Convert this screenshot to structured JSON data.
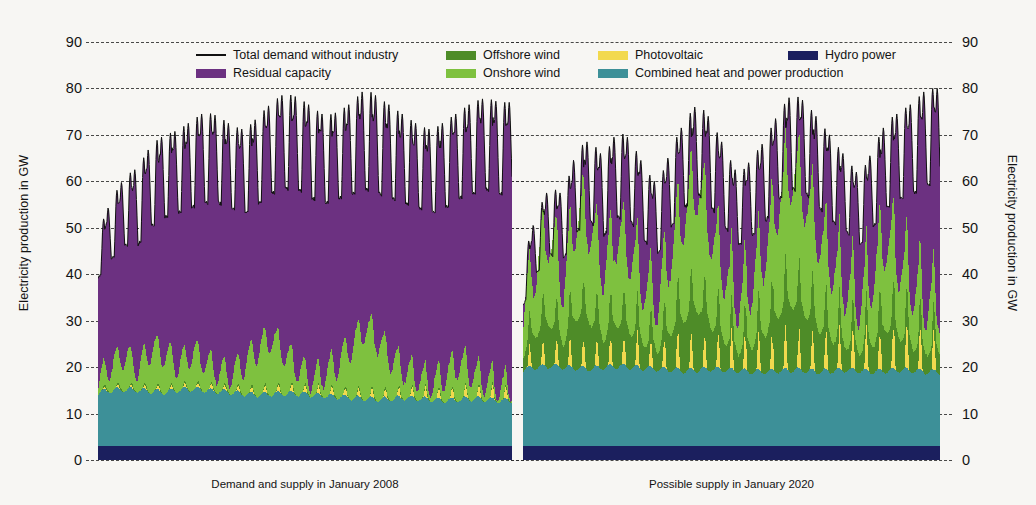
{
  "chart_data": {
    "type": "area",
    "title": "",
    "ylabel": "Electricity production in GW",
    "xlabel": "",
    "ylim": [
      0,
      90
    ],
    "yticks": [
      0,
      10,
      20,
      30,
      40,
      50,
      60,
      70,
      80,
      90
    ],
    "grid": true,
    "legend_position": "top-center",
    "stack_order_bottom_to_top": [
      "Hydro power",
      "Combined heat and power production",
      "Photovoltaic",
      "Offshore wind",
      "Onshore wind",
      "Residual capacity"
    ],
    "legend": [
      {
        "label": "Total demand without industry",
        "color": "#111111",
        "marker": "line"
      },
      {
        "label": "Residual capacity",
        "color": "#6c3181",
        "marker": "swatch"
      },
      {
        "label": "Offshore wind",
        "color": "#4e8c28",
        "marker": "swatch"
      },
      {
        "label": "Onshore wind",
        "color": "#7ec13f",
        "marker": "swatch"
      },
      {
        "label": "Photovoltaic",
        "color": "#f2d94e",
        "marker": "swatch"
      },
      {
        "label": "Combined heat and power production",
        "color": "#3d9098",
        "marker": "swatch"
      },
      {
        "label": "Hydro power",
        "color": "#1b1f5e",
        "marker": "swatch"
      }
    ],
    "panels": [
      {
        "id": "left",
        "caption": "Demand and supply in January 2008",
        "x_range_days": [
          1,
          31
        ],
        "series": {
          "hydro": [
            3.0,
            3.0,
            3.0,
            3.0,
            3.0,
            3.0,
            3.0,
            3.0,
            3.0,
            3.0,
            3.0,
            3.0,
            3.0,
            3.0,
            3.0,
            3.0,
            3.0,
            3.0,
            3.0,
            3.0,
            3.0,
            3.0,
            3.0,
            3.0,
            3.0,
            3.0,
            3.0,
            3.0,
            3.0,
            3.0,
            3.0
          ],
          "chp": [
            11.5,
            12.0,
            12.2,
            12.0,
            11.8,
            11.6,
            12.0,
            12.3,
            12.0,
            11.8,
            11.5,
            11.2,
            11.0,
            11.2,
            11.4,
            11.2,
            11.0,
            10.8,
            10.6,
            10.4,
            10.2,
            10.0,
            10.2,
            10.4,
            10.2,
            10.0,
            9.8,
            10.0,
            10.2,
            10.0,
            9.8
          ],
          "photovoltaic": [
            0.2,
            0.2,
            0.2,
            0.3,
            0.3,
            0.3,
            0.3,
            0.4,
            0.4,
            0.4,
            0.4,
            0.4,
            0.5,
            0.5,
            0.5,
            0.5,
            0.6,
            0.6,
            0.6,
            0.6,
            0.7,
            0.7,
            0.7,
            0.7,
            0.8,
            0.8,
            0.8,
            0.8,
            0.9,
            0.9,
            0.9
          ],
          "offshore_wind": [
            0.1,
            0.1,
            0.1,
            0.1,
            0.1,
            0.1,
            0.1,
            0.1,
            0.1,
            0.1,
            0.1,
            0.1,
            0.1,
            0.1,
            0.1,
            0.1,
            0.1,
            0.1,
            0.1,
            0.1,
            0.1,
            0.1,
            0.1,
            0.1,
            0.1,
            0.1,
            0.1,
            0.1,
            0.1,
            0.1,
            0.1
          ],
          "onshore_wind": [
            2.0,
            5.5,
            7.0,
            4.5,
            9.0,
            8.0,
            5.0,
            7.5,
            6.0,
            4.0,
            3.5,
            6.5,
            9.5,
            12.0,
            8.0,
            5.0,
            3.0,
            4.5,
            7.0,
            11.0,
            15.0,
            12.0,
            8.0,
            5.5,
            4.0,
            3.0,
            5.0,
            7.5,
            5.0,
            3.5,
            2.5
          ],
          "residual_peak": [
            48,
            55,
            60,
            62,
            67,
            69,
            70,
            72,
            74,
            73,
            71,
            70,
            73,
            76,
            78,
            77,
            75,
            73,
            74,
            76,
            78,
            77,
            75,
            73,
            71,
            70,
            72,
            74,
            76,
            77,
            76
          ],
          "total_demand_peak": [
            49,
            56,
            61,
            63,
            68,
            70,
            71,
            73,
            75,
            74,
            72,
            71,
            74,
            77,
            79,
            78,
            76,
            74,
            75,
            77,
            80,
            78,
            76,
            74,
            72,
            71,
            73,
            75,
            77,
            78,
            77
          ],
          "total_demand_trough": [
            39,
            43,
            46,
            46,
            50,
            52,
            53,
            54,
            55,
            55,
            54,
            53,
            55,
            57,
            58,
            58,
            56,
            55,
            56,
            57,
            58,
            57,
            56,
            55,
            54,
            53,
            54,
            56,
            57,
            58,
            57
          ]
        }
      },
      {
        "id": "right",
        "caption": "Possible supply in January 2020",
        "x_range_days": [
          1,
          31
        ],
        "series": {
          "hydro": [
            3.0,
            3.0,
            3.0,
            3.0,
            3.0,
            3.0,
            3.0,
            3.0,
            3.0,
            3.0,
            3.0,
            3.0,
            3.0,
            3.0,
            3.0,
            3.0,
            3.0,
            3.0,
            3.0,
            3.0,
            3.0,
            3.0,
            3.0,
            3.0,
            3.0,
            3.0,
            3.0,
            3.0,
            3.0,
            3.0,
            3.0
          ],
          "chp": [
            16.5,
            17.0,
            17.2,
            17.0,
            16.8,
            16.6,
            17.0,
            17.2,
            17.0,
            16.8,
            16.6,
            16.4,
            16.2,
            16.4,
            16.6,
            16.4,
            16.2,
            16.0,
            16.0,
            16.2,
            16.4,
            16.2,
            16.0,
            16.2,
            16.4,
            16.2,
            16.0,
            16.2,
            16.4,
            16.2,
            16.0
          ],
          "photovoltaic": [
            1.5,
            1.8,
            2.0,
            2.2,
            2.4,
            2.2,
            2.0,
            2.4,
            2.6,
            2.4,
            2.2,
            2.6,
            2.8,
            2.6,
            2.4,
            2.8,
            3.0,
            2.8,
            2.6,
            3.0,
            3.2,
            3.0,
            2.8,
            3.2,
            3.4,
            3.2,
            3.0,
            3.4,
            3.6,
            3.4,
            3.2
          ],
          "offshore_wind": [
            4.0,
            8.0,
            10.0,
            6.0,
            12.0,
            11.0,
            7.0,
            10.0,
            8.5,
            6.0,
            5.0,
            9.0,
            12.0,
            14.0,
            10.0,
            7.0,
            5.0,
            6.5,
            9.0,
            13.0,
            15.0,
            13.0,
            10.0,
            7.5,
            6.0,
            5.0,
            7.0,
            10.0,
            8.0,
            6.0,
            5.0
          ],
          "onshore_wind": [
            8.0,
            14.0,
            18.0,
            11.0,
            21.0,
            19.0,
            13.0,
            18.0,
            15.0,
            11.0,
            9.0,
            16.0,
            21.0,
            25.0,
            18.0,
            13.0,
            9.0,
            12.0,
            16.0,
            23.0,
            27.0,
            23.0,
            18.0,
            14.0,
            11.0,
            9.0,
            13.0,
            18.0,
            14.0,
            11.0,
            9.0
          ],
          "residual_peak": [
            42,
            52,
            58,
            56,
            66,
            68,
            64,
            70,
            68,
            62,
            58,
            66,
            72,
            76,
            72,
            66,
            60,
            64,
            68,
            74,
            78,
            76,
            72,
            68,
            64,
            60,
            66,
            72,
            74,
            76,
            80
          ],
          "total_demand_peak": [
            43,
            53,
            59,
            57,
            67,
            69,
            65,
            71,
            69,
            63,
            59,
            67,
            73,
            77,
            73,
            67,
            61,
            65,
            69,
            75,
            79,
            77,
            73,
            69,
            65,
            61,
            67,
            73,
            75,
            77,
            80
          ],
          "total_demand_trough": [
            33,
            40,
            44,
            43,
            49,
            51,
            48,
            52,
            51,
            47,
            44,
            50,
            54,
            57,
            54,
            50,
            46,
            48,
            51,
            56,
            58,
            57,
            54,
            51,
            49,
            46,
            50,
            54,
            56,
            57,
            59
          ]
        }
      }
    ]
  },
  "axes": {
    "ylabel_left": "Electricity production in GW",
    "ylabel_right": "Electricity production in GW",
    "ticks": [
      "90",
      "80",
      "70",
      "60",
      "50",
      "40",
      "30",
      "20",
      "10",
      "0"
    ]
  },
  "legend": {
    "items": [
      {
        "label": "Total demand without industry",
        "color": "#111111",
        "type": "line"
      },
      {
        "label": "Offshore wind",
        "color": "#4e8c28",
        "type": "swatch"
      },
      {
        "label": "Photovoltaic",
        "color": "#f2d94e",
        "type": "swatch"
      },
      {
        "label": "Hydro power",
        "color": "#1b1f5e",
        "type": "swatch"
      },
      {
        "label": "Residual capacity",
        "color": "#6c3181",
        "type": "swatch"
      },
      {
        "label": "Onshore wind",
        "color": "#7ec13f",
        "type": "swatch"
      },
      {
        "label": "Combined heat and power production",
        "color": "#3d9098",
        "type": "swatch"
      }
    ]
  },
  "captions": {
    "left": "Demand and supply in January 2008",
    "right": "Possible supply in January 2020"
  }
}
